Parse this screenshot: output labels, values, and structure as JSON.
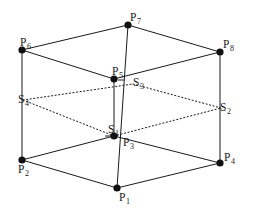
{
  "figure": {
    "type": "geometric-diagram",
    "width": 257,
    "height": 212,
    "background_color": "#ffffff",
    "stroke_color": "#1a1a1a",
    "vertex_fill_color": "#111111"
  },
  "vertices": [
    {
      "id": "P1",
      "base": "P",
      "sub": "1",
      "x": 117,
      "y": 188,
      "dot": true,
      "label_dx": 2,
      "label_dy": 4
    },
    {
      "id": "P2",
      "base": "P",
      "sub": "2",
      "x": 22,
      "y": 160,
      "dot": true,
      "label_dx": -4,
      "label_dy": 4
    },
    {
      "id": "P3",
      "base": "P",
      "sub": "3",
      "x": 114,
      "y": 136,
      "dot": true,
      "label_dx": 9,
      "label_dy": 1
    },
    {
      "id": "P4",
      "base": "P",
      "sub": "4",
      "x": 220,
      "y": 163,
      "dot": true,
      "label_dx": 4,
      "label_dy": -11
    },
    {
      "id": "P5",
      "base": "P",
      "sub": "5",
      "x": 114,
      "y": 79,
      "dot": true,
      "label_dx": -2,
      "label_dy": -13
    },
    {
      "id": "P6",
      "base": "P",
      "sub": "6",
      "x": 22,
      "y": 50,
      "dot": true,
      "label_dx": -2,
      "label_dy": -13
    },
    {
      "id": "P7",
      "base": "P",
      "sub": "7",
      "x": 128,
      "y": 25,
      "dot": true,
      "label_dx": 2,
      "label_dy": -13
    },
    {
      "id": "P8",
      "base": "P",
      "sub": "8",
      "x": 220,
      "y": 52,
      "dot": true,
      "label_dx": 3,
      "label_dy": -13
    },
    {
      "id": "S1",
      "base": "S",
      "sub": "1",
      "x": 114,
      "y": 136,
      "dot": false,
      "label_dx": -6,
      "label_dy": -12
    },
    {
      "id": "S2",
      "base": "S",
      "sub": "2",
      "x": 221,
      "y": 108,
      "dot": false,
      "label_dx": -1,
      "label_dy": -6
    },
    {
      "id": "S3",
      "base": "S",
      "sub": "3",
      "x": 133,
      "y": 84,
      "dot": false,
      "label_dx": 0,
      "label_dy": -7
    },
    {
      "id": "S4",
      "base": "S",
      "sub": "4",
      "x": 23,
      "y": 100,
      "dot": false,
      "label_dx": -5,
      "label_dy": -6
    }
  ],
  "edges": {
    "solid": [
      {
        "name": "bottom-front-left",
        "from": "P2",
        "to": "P1"
      },
      {
        "name": "bottom-front-right",
        "from": "P1",
        "to": "P4"
      },
      {
        "name": "bottom-back-left",
        "from": "P2",
        "to": "P3"
      },
      {
        "name": "bottom-back-right",
        "from": "P3",
        "to": "P4"
      },
      {
        "name": "top-front-left",
        "from": "P6",
        "to": "P5"
      },
      {
        "name": "top-front-right",
        "from": "P5",
        "to": "P8"
      },
      {
        "name": "top-back-left",
        "from": "P6",
        "to": "P7"
      },
      {
        "name": "top-back-right",
        "from": "P7",
        "to": "P8"
      },
      {
        "name": "vertical-left",
        "from": "P6",
        "to": "P2"
      },
      {
        "name": "vertical-center",
        "from": "P5",
        "to": "P3"
      },
      {
        "name": "vertical-right",
        "from": "P8",
        "to": "P4"
      },
      {
        "name": "vertical-back",
        "from": "P7",
        "to": "P1"
      }
    ],
    "dotted": [
      {
        "name": "mid-plane-left-front",
        "from": "S4",
        "to": "S1"
      },
      {
        "name": "mid-plane-right-front",
        "from": "S1",
        "to": "S2"
      },
      {
        "name": "mid-plane-left-back",
        "from": "S4",
        "to": "S3"
      },
      {
        "name": "mid-plane-right-back",
        "from": "S3",
        "to": "S2"
      }
    ]
  },
  "ticks": [
    {
      "name": "tick-s1",
      "x": 114,
      "y": 136,
      "dx": -6,
      "dy": 0
    },
    {
      "name": "tick-s3",
      "x": 121,
      "y": 80,
      "dx": 0,
      "dy": 0
    }
  ]
}
